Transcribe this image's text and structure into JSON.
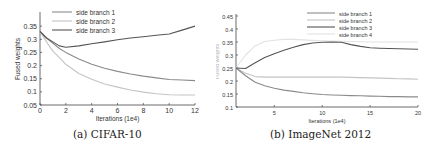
{
  "chart_data": [
    {
      "type": "line",
      "caption": "(a) CIFAR-10",
      "title": "",
      "xlabel": "Iterations (1e4)",
      "ylabel": "Fused weights",
      "xlim": [
        0,
        12
      ],
      "ylim": [
        0.05,
        0.4
      ],
      "xticks": [
        "0",
        "2",
        "4",
        "6",
        "8",
        "10",
        "12"
      ],
      "yticks": [
        "0.05",
        "0.1",
        "0.15",
        "0.2",
        "0.25",
        "0.3",
        "0.35"
      ],
      "grid": false,
      "legend_position": "upper center",
      "x": [
        0,
        0.5,
        1,
        1.5,
        2,
        3,
        4,
        5,
        6,
        7,
        8,
        9,
        10,
        11,
        12
      ],
      "series": [
        {
          "name": "side branch 1",
          "color": "#8a8a8a",
          "values": [
            0.33,
            0.305,
            0.285,
            0.265,
            0.25,
            0.225,
            0.205,
            0.19,
            0.178,
            0.168,
            0.16,
            0.153,
            0.147,
            0.145,
            0.143
          ]
        },
        {
          "name": "side branch 2",
          "color": "#c4c4c4",
          "values": [
            0.33,
            0.29,
            0.255,
            0.23,
            0.205,
            0.17,
            0.148,
            0.13,
            0.118,
            0.107,
            0.099,
            0.093,
            0.089,
            0.088,
            0.088
          ]
        },
        {
          "name": "side branch 3",
          "color": "#555555",
          "values": [
            0.33,
            0.305,
            0.29,
            0.275,
            0.27,
            0.275,
            0.283,
            0.29,
            0.298,
            0.305,
            0.31,
            0.315,
            0.32,
            0.335,
            0.35
          ]
        }
      ]
    },
    {
      "type": "line",
      "caption": "(b) ImageNet 2012",
      "title": "",
      "xlabel": "Iterations (1e4)",
      "ylabel": "Fused weights",
      "xlim": [
        1,
        20
      ],
      "ylim": [
        0.1,
        0.45
      ],
      "xticks": [
        "5",
        "10",
        "15",
        "20"
      ],
      "yticks": [
        "0.1",
        "0.15",
        "0.2",
        "0.25",
        "0.3",
        "0.35",
        "0.4",
        "0.45"
      ],
      "grid": false,
      "legend_position": "upper right",
      "x": [
        1,
        2,
        3,
        4,
        5,
        6,
        7,
        8,
        9,
        10,
        11,
        12,
        13,
        14,
        15,
        16,
        17,
        18,
        19,
        20
      ],
      "series": [
        {
          "name": "side branch 1",
          "color": "#8a8a8a",
          "values": [
            0.25,
            0.22,
            0.195,
            0.182,
            0.172,
            0.165,
            0.16,
            0.155,
            0.151,
            0.148,
            0.146,
            0.145,
            0.144,
            0.143,
            0.142,
            0.141,
            0.14,
            0.14,
            0.139,
            0.139
          ]
        },
        {
          "name": "side branch 2",
          "color": "#c4c4c4",
          "values": [
            0.25,
            0.23,
            0.217,
            0.215,
            0.215,
            0.215,
            0.215,
            0.215,
            0.215,
            0.215,
            0.215,
            0.215,
            0.214,
            0.213,
            0.212,
            0.211,
            0.21,
            0.209,
            0.208,
            0.207
          ]
        },
        {
          "name": "side branch 3",
          "color": "#555555",
          "values": [
            0.25,
            0.248,
            0.27,
            0.29,
            0.305,
            0.318,
            0.33,
            0.34,
            0.346,
            0.349,
            0.35,
            0.349,
            0.34,
            0.333,
            0.328,
            0.326,
            0.325,
            0.324,
            0.323,
            0.322
          ]
        },
        {
          "name": "side branch 4",
          "color": "#e2e2e2",
          "values": [
            0.25,
            0.3,
            0.335,
            0.352,
            0.357,
            0.36,
            0.36,
            0.358,
            0.356,
            0.355,
            0.354,
            0.353,
            0.352,
            0.351,
            0.35,
            0.35,
            0.35,
            0.35,
            0.35,
            0.35
          ]
        }
      ]
    }
  ]
}
